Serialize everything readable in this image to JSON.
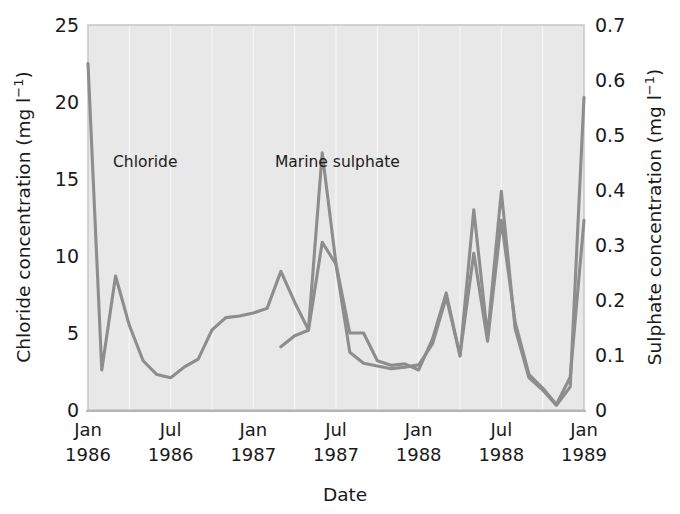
{
  "figure": {
    "background_color": "#ffffff",
    "plot_background_color": "#e8e8e8",
    "line_color": "#8d8d8d",
    "gridline_color": "#f4f4f4"
  },
  "axes": {
    "left": {
      "title_main": "Chloride concentration (mg l",
      "title_sup": "−1",
      "title_tail": ")",
      "ticks": [
        "0",
        "5",
        "10",
        "15",
        "20",
        "25"
      ],
      "min": 0,
      "max": 25
    },
    "right": {
      "title_main": "Sulphate concentration (mg l",
      "title_sup": "−1",
      "title_tail": ")",
      "ticks": [
        "0",
        "0.1",
        "0.2",
        "0.3",
        "0.4",
        "0.5",
        "0.6",
        "0.7"
      ],
      "min": 0,
      "max": 0.7
    },
    "bottom": {
      "title": "Date",
      "ticks": [
        {
          "month": "Jan",
          "year": "1986"
        },
        {
          "month": "Jul",
          "year": "1986"
        },
        {
          "month": "Jan",
          "year": "1987"
        },
        {
          "month": "Jul",
          "year": "1987"
        },
        {
          "month": "Jan",
          "year": "1988"
        },
        {
          "month": "Jul",
          "year": "1988"
        },
        {
          "month": "Jan",
          "year": "1989"
        }
      ]
    }
  },
  "annotations": {
    "chloride_label": "Chloride",
    "sulphate_label": "Marine sulphate"
  },
  "chart_data": {
    "type": "line",
    "title": "",
    "xlabel": "Date",
    "ylabel": "Chloride concentration (mg l−1)",
    "y2label": "Sulphate concentration (mg l−1)",
    "ylim": [
      0,
      25
    ],
    "y2lim": [
      0,
      0.7
    ],
    "xlim": [
      "1986-01",
      "1989-01"
    ],
    "grid": "vertical-quarterly",
    "legend": "inline-annotations",
    "series": [
      {
        "name": "Chloride",
        "axis": "left",
        "units": "mg l-1",
        "x": [
          "1986-01",
          "1986-02",
          "1986-03",
          "1986-04",
          "1986-05",
          "1986-06",
          "1986-07",
          "1986-08",
          "1986-09",
          "1986-10",
          "1986-11",
          "1986-12",
          "1987-01",
          "1987-02",
          "1987-03",
          "1987-04",
          "1987-05",
          "1987-06",
          "1987-07",
          "1987-08",
          "1987-09",
          "1987-10",
          "1987-11",
          "1987-12",
          "1988-01",
          "1988-02",
          "1988-03",
          "1988-04",
          "1988-05",
          "1988-06",
          "1988-07",
          "1988-08",
          "1988-09",
          "1988-10",
          "1988-11",
          "1988-12",
          "1989-01"
        ],
        "values": [
          22.5,
          2.6,
          8.7,
          5.5,
          3.2,
          2.3,
          2.1,
          2.8,
          3.3,
          5.2,
          6.0,
          6.1,
          6.3,
          6.6,
          9.0,
          7.0,
          5.2,
          16.7,
          9.5,
          5.0,
          5.0,
          3.2,
          2.9,
          3.0,
          2.6,
          4.6,
          7.6,
          3.5,
          13.0,
          4.8,
          14.2,
          5.3,
          2.1,
          1.3,
          0.3,
          1.5,
          20.3
        ]
      },
      {
        "name": "Marine sulphate",
        "axis": "right",
        "units": "mg l-1",
        "x": [
          "1987-03",
          "1987-04",
          "1987-05",
          "1987-06",
          "1987-07",
          "1987-08",
          "1987-09",
          "1987-10",
          "1987-11",
          "1987-12",
          "1988-01",
          "1988-02",
          "1988-03",
          "1988-04",
          "1988-05",
          "1988-06",
          "1988-07",
          "1988-08",
          "1988-09",
          "1988-10",
          "1988-11",
          "1988-12",
          "1989-01"
        ],
        "values": [
          0.115,
          0.135,
          0.145,
          0.305,
          0.265,
          0.105,
          0.085,
          0.08,
          0.075,
          0.078,
          0.082,
          0.12,
          0.205,
          0.1,
          0.285,
          0.125,
          0.345,
          0.16,
          0.065,
          0.04,
          0.01,
          0.06,
          0.345
        ]
      }
    ]
  }
}
